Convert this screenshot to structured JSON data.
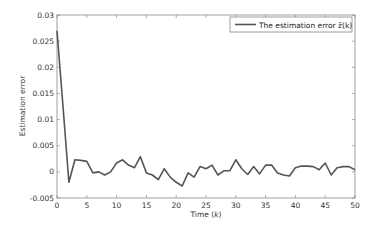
{
  "chart_data": {
    "type": "line",
    "title": "",
    "xlabel": "Time (k)",
    "ylabel": "Estimation error",
    "xlim": [
      0,
      50
    ],
    "ylim": [
      -0.005,
      0.03
    ],
    "xticks": [
      0,
      5,
      10,
      15,
      20,
      25,
      30,
      35,
      40,
      45,
      50
    ],
    "yticks": [
      -0.005,
      0,
      0.005,
      0.01,
      0.015,
      0.02,
      0.025,
      0.03
    ],
    "ytick_labels": [
      "-0.005",
      "0",
      "0.005",
      "0.01",
      "0.015",
      "0.02",
      "0.025",
      "0.03"
    ],
    "grid": false,
    "legend_position": "upper right",
    "series": [
      {
        "name": "The estimation error z̃(k)",
        "color": "#555555",
        "x": [
          0,
          1,
          2,
          3,
          4,
          5,
          6,
          7,
          8,
          9,
          10,
          11,
          12,
          13,
          14,
          15,
          16,
          17,
          18,
          19,
          20,
          21,
          22,
          23,
          24,
          25,
          26,
          27,
          28,
          29,
          30,
          31,
          32,
          33,
          34,
          35,
          36,
          37,
          38,
          39,
          40,
          41,
          42,
          43,
          44,
          45,
          46,
          47,
          48,
          49,
          50
        ],
        "values": [
          0.027,
          0.0125,
          -0.002,
          0.0023,
          0.0022,
          0.002,
          -0.0002,
          0.0,
          -0.0006,
          0.0,
          0.0017,
          0.0023,
          0.0013,
          0.0008,
          0.0029,
          -0.0002,
          -0.0006,
          -0.0015,
          0.0006,
          -0.001,
          -0.002,
          -0.0027,
          -0.0002,
          -0.001,
          0.001,
          0.0006,
          0.0013,
          -0.0006,
          0.0002,
          0.0002,
          0.0023,
          0.0006,
          -0.0005,
          0.001,
          -0.0004,
          0.0013,
          0.0013,
          -0.0002,
          -0.0006,
          -0.0008,
          0.0008,
          0.0011,
          0.0011,
          0.001,
          0.0004,
          0.0017,
          -0.0006,
          0.0008,
          0.001,
          0.001,
          0.0004
        ]
      }
    ]
  },
  "labels": {
    "xlabel_text": "Time (",
    "xlabel_var": "k",
    "xlabel_close": ")",
    "ylabel": "Estimation error",
    "legend": "The estimation error z̃(k)"
  }
}
